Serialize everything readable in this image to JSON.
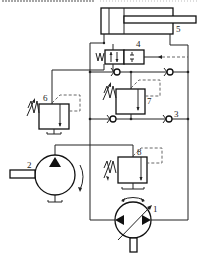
{
  "diagram": {
    "title": "",
    "type": "hydraulic circuit schematic",
    "top_cut_text": "",
    "components": [
      {
        "id": "1",
        "label": "1",
        "name": "variable displacement bidirectional pump/motor"
      },
      {
        "id": "2",
        "label": "2",
        "name": "hydraulic pump"
      },
      {
        "id": "3",
        "label": "3",
        "name": "check valve"
      },
      {
        "id": "4",
        "label": "4",
        "name": "directional control valve (2-position, spring return, pilot operated)"
      },
      {
        "id": "5",
        "label": "5",
        "name": "hydraulic cylinder"
      },
      {
        "id": "6",
        "label": "6",
        "name": "relief valve"
      },
      {
        "id": "7",
        "label": "7",
        "name": "relief valve"
      },
      {
        "id": "8",
        "label": "8",
        "name": "relief valve"
      }
    ]
  }
}
